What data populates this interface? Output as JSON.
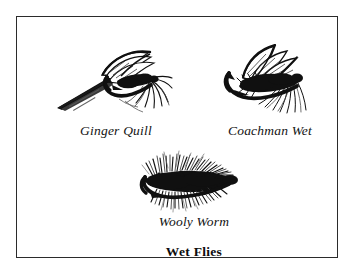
{
  "plate": {
    "title": "Wet Flies",
    "border_color": "#2b2b2b",
    "background_color": "#ffffff",
    "ink_color": "#101010"
  },
  "flies": [
    {
      "id": "ginger-quill",
      "name": "Ginger Quill",
      "icon": "wet-fly-ginger-quill-illustration"
    },
    {
      "id": "coachman-wet",
      "name": "Coachman Wet",
      "icon": "wet-fly-coachman-wet-illustration"
    },
    {
      "id": "wooly-worm",
      "name": "Wooly Worm",
      "icon": "wet-fly-wooly-worm-illustration"
    }
  ]
}
